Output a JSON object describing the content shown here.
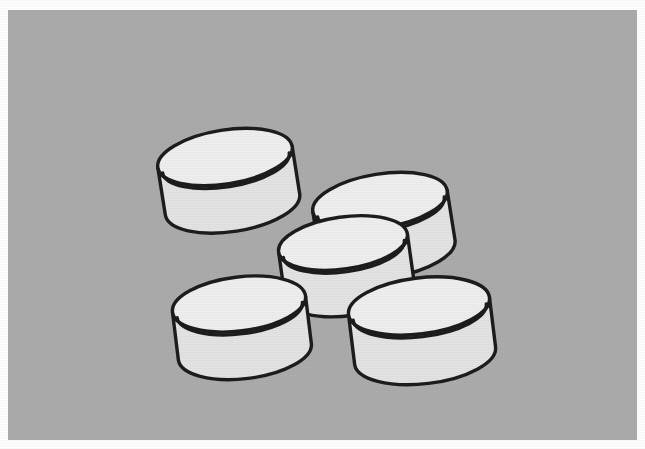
{
  "image": {
    "title": "Line drawing of five open cylindrical bowls",
    "subject": "bowls",
    "style": "black-outline line art",
    "width": 645,
    "height": 449,
    "object_count": 5
  },
  "colors": {
    "page_background": "#ffffff",
    "scene_background": "#acacac",
    "outline": "#1c1c1c",
    "rim_top_fill": "#efefef",
    "interior_fill": "#d8d8d8",
    "wall_fill": "#e4e4e4",
    "wall_shadow_fill": "#dcdcdc"
  },
  "scene": {
    "label": "gray backdrop",
    "x": 8,
    "y": 10,
    "width": 629,
    "height": 430
  },
  "objects": [
    {
      "id": "bowl-top-left",
      "label": "Bowl 1 (upper left)",
      "position": "upper-left",
      "center_x": 225,
      "center_y": 157,
      "rim_rx": 68,
      "rim_ry": 27,
      "wall_height": 48,
      "rotation_deg": -9,
      "z": 1,
      "occluded": false
    },
    {
      "id": "bowl-upper-right",
      "label": "Bowl 2 (upper right)",
      "position": "upper-right",
      "center_x": 380,
      "center_y": 201,
      "rim_rx": 68,
      "rim_ry": 27,
      "wall_height": 50,
      "rotation_deg": -9,
      "z": 2,
      "occluded": true
    },
    {
      "id": "bowl-center",
      "label": "Bowl 3 (center)",
      "position": "center",
      "center_x": 343,
      "center_y": 243,
      "rim_rx": 65,
      "rim_ry": 26,
      "wall_height": 47,
      "rotation_deg": -8,
      "z": 3,
      "occluded": false
    },
    {
      "id": "bowl-bottom-left",
      "label": "Bowl 4 (lower left)",
      "position": "lower-left",
      "center_x": 239,
      "center_y": 304,
      "rim_rx": 67,
      "rim_ry": 27,
      "wall_height": 48,
      "rotation_deg": -7,
      "z": 4,
      "occluded": false
    },
    {
      "id": "bowl-bottom-right",
      "label": "Bowl 5 (lower right)",
      "position": "lower-right",
      "center_x": 419,
      "center_y": 306,
      "rim_rx": 71,
      "rim_ry": 28,
      "wall_height": 50,
      "rotation_deg": -7,
      "z": 5,
      "occluded": false
    }
  ]
}
